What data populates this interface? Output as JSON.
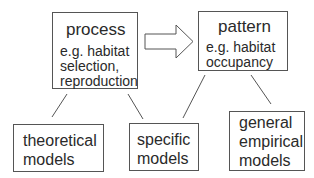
{
  "diagram": {
    "process_box": {
      "title": "process",
      "example_lines": [
        "e.g. habitat",
        "selection,",
        "reproduction"
      ]
    },
    "arrow": {
      "direction": "right",
      "from": "process",
      "to": "pattern"
    },
    "pattern_box": {
      "title": "pattern",
      "example_lines": [
        "e.g. habitat",
        "occupancy"
      ]
    },
    "model_boxes": [
      {
        "lines": [
          "theoretical",
          "models"
        ]
      },
      {
        "lines": [
          "specific",
          "models"
        ]
      },
      {
        "lines": [
          "general",
          "empirical",
          "models"
        ]
      }
    ],
    "connections": [
      {
        "from": "process",
        "to": "theoretical models"
      },
      {
        "from": "process",
        "to": "specific models"
      },
      {
        "from": "pattern",
        "to": "specific models"
      },
      {
        "from": "pattern",
        "to": "general empirical models"
      }
    ],
    "colors": {
      "stroke": "#555555",
      "text": "#2a2a2a",
      "background": "#ffffff"
    }
  }
}
